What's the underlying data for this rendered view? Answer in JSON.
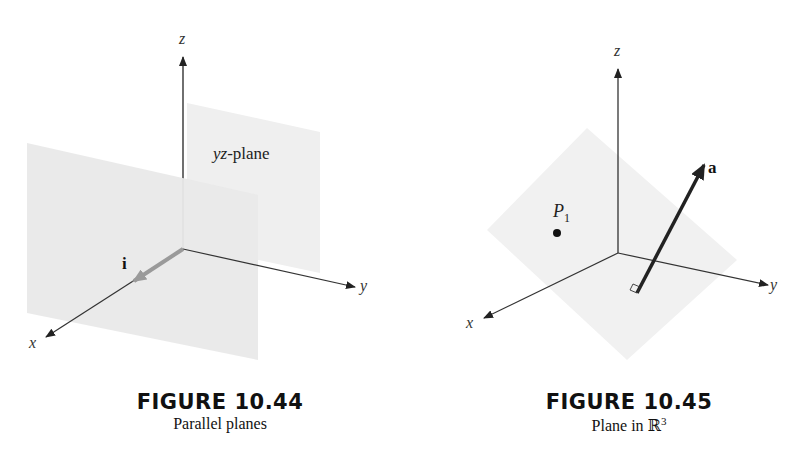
{
  "figures": [
    {
      "title": "FIGURE 10.44",
      "caption": "Parallel planes",
      "axes": {
        "x": "x",
        "y": "y",
        "z": "z"
      },
      "plane_label_italic": "yz",
      "plane_label_rest": "-plane",
      "vector_label": "i"
    },
    {
      "title": "FIGURE 10.45",
      "caption_text": "Plane in ",
      "caption_symbol": "ℝ",
      "caption_sup": "3",
      "axes": {
        "x": "x",
        "y": "y",
        "z": "z"
      },
      "point_label": "P",
      "point_sub": "1",
      "vector_label": "a"
    }
  ],
  "colors": {
    "plane_fill": "#ececec",
    "plane_fill_back": "#f0f0f0",
    "axis": "#222222",
    "i_vector": "#9a9a9a",
    "a_vector": "#222222"
  }
}
